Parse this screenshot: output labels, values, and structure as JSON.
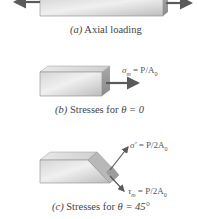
{
  "figure": {
    "panels": [
      {
        "id": "a",
        "caption_letter": "(a)",
        "caption_text": "Axial loading"
      },
      {
        "id": "b",
        "caption_letter": "(b)",
        "caption_text": "Stresses for",
        "caption_theta": "θ = 0",
        "stress_label_symbol": "σ",
        "stress_label_sub": "m",
        "stress_label_eq": " = P/A",
        "stress_label_eq_sub": "0"
      },
      {
        "id": "c",
        "caption_letter": "(c)",
        "caption_text": "Stresses for",
        "caption_theta": "θ = 45°",
        "normal_label_symbol": "σ′",
        "normal_label_eq": " = P/2A",
        "normal_label_eq_sub": "0",
        "shear_label_symbol": "τ",
        "shear_label_sub": "m",
        "shear_label_eq": " = P/2A",
        "shear_label_eq_sub": "0"
      }
    ],
    "colors": {
      "arrow": "#5a5a5a",
      "block_light": "#e4e4e4",
      "block_mid": "#c4c4c4",
      "block_dark": "#9a9a9a",
      "text": "#444444"
    }
  }
}
